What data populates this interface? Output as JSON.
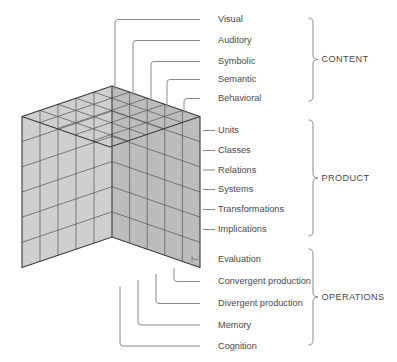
{
  "figure": {
    "cube": {
      "name": "soi-cube",
      "divisions_x": 5,
      "divisions_y": 6,
      "divisions_z": 5,
      "face_colors": {
        "top": "#e3e3e3",
        "left": "#cfcfcf",
        "right": "#bcbcbc",
        "edge": "#5b5b5b"
      }
    },
    "dimensions": [
      {
        "key": "content",
        "group_label": "CONTENT",
        "labels": [
          "Visual",
          "Auditory",
          "Symbolic",
          "Semantic",
          "Behavioral"
        ]
      },
      {
        "key": "product",
        "group_label": "PRODUCT",
        "labels": [
          "Units",
          "Classes",
          "Relations",
          "Systems",
          "Transformations",
          "Implications"
        ]
      },
      {
        "key": "operations",
        "group_label": "OPERATIONS",
        "labels": [
          "Evaluation",
          "Convergent production",
          "Divergent production",
          "Memory",
          "Cognition"
        ]
      }
    ]
  }
}
